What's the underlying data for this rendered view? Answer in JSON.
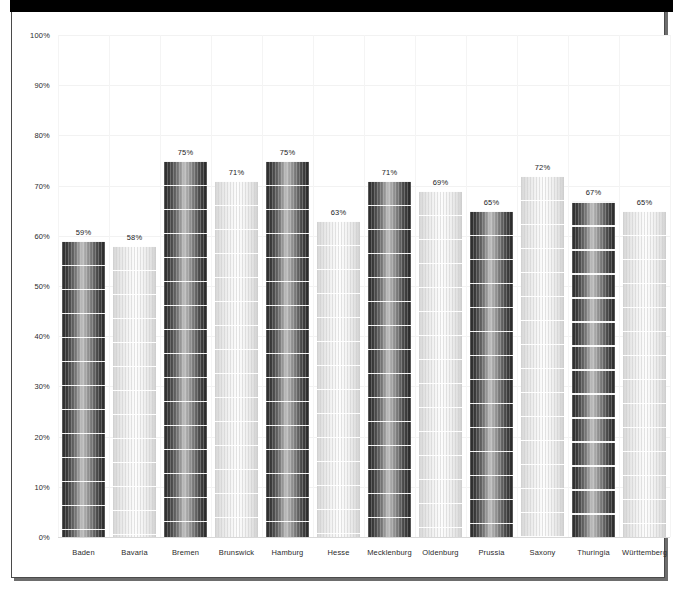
{
  "figure": {
    "background_color": "#ffffff",
    "frame_color": "#4a4a4a",
    "top_bar_color": "#000000"
  },
  "chart_data": {
    "type": "bar",
    "title": "",
    "subtitle": "",
    "xlabel": "",
    "ylabel": "",
    "ylim": [
      0,
      100
    ],
    "grid": true,
    "legend": "none",
    "value_suffix": "%",
    "categories": [
      "Baden",
      "Bavaria",
      "Bremen",
      "Brunswick",
      "Hamburg",
      "Hesse",
      "Mecklenburg",
      "Oldenburg",
      "Prussia",
      "Saxony",
      "Thuringia",
      "Württemberg"
    ],
    "values": [
      59,
      58,
      75,
      71,
      75,
      63,
      71,
      69,
      65,
      72,
      67,
      65
    ],
    "data_labels": [
      "59%",
      "58%",
      "75%",
      "71%",
      "75%",
      "63%",
      "71%",
      "69%",
      "65%",
      "72%",
      "67%",
      "65%"
    ],
    "bar_styles": [
      "dark",
      "light",
      "dark",
      "light",
      "dark",
      "light",
      "dark",
      "light",
      "dark",
      "light",
      "dark",
      "light"
    ],
    "y_ticks": [
      0,
      10,
      20,
      30,
      40,
      50,
      60,
      70,
      80,
      90,
      100
    ],
    "y_tick_labels": [
      "0%",
      "10%",
      "20%",
      "30%",
      "40%",
      "50%",
      "60%",
      "70%",
      "80%",
      "90%",
      "100%"
    ],
    "colors": {
      "bar_dark": "#2a2a2a",
      "bar_light": "#e8e8e8",
      "gridline": "#f2f2f2",
      "text": "#2b2b2b"
    }
  }
}
